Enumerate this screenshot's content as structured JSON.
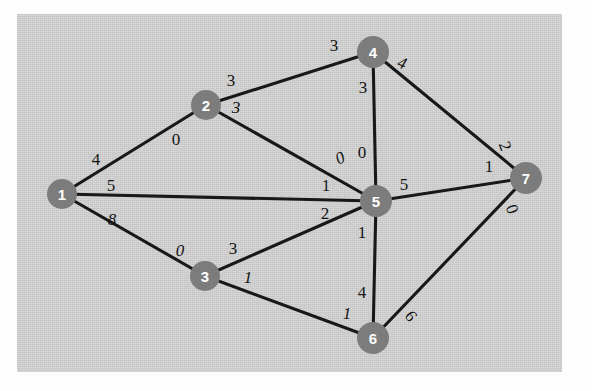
{
  "figure": {
    "kind": "weighted-undirected-graph",
    "background_color": "#d2d2d2",
    "page_color": "#fdfdfd",
    "node_color": "#7c7c7c",
    "node_text_color": "#ffffff",
    "edge_color": "#181818",
    "label_color": "#131313"
  },
  "chart_data": {
    "type": "diagram",
    "title": "",
    "nodes": [
      {
        "id": "1",
        "label": "1",
        "x": 62,
        "y": 194,
        "r": 15
      },
      {
        "id": "2",
        "label": "2",
        "x": 206,
        "y": 105,
        "r": 15
      },
      {
        "id": "3",
        "label": "3",
        "x": 205,
        "y": 276,
        "r": 15
      },
      {
        "id": "4",
        "label": "4",
        "x": 373,
        "y": 52,
        "r": 16
      },
      {
        "id": "5",
        "label": "5",
        "x": 376,
        "y": 201,
        "r": 16
      },
      {
        "id": "6",
        "label": "6",
        "x": 373,
        "y": 338,
        "r": 16
      },
      {
        "id": "7",
        "label": "7",
        "x": 526,
        "y": 178,
        "r": 16
      }
    ],
    "edges": [
      {
        "from": "1",
        "to": "2",
        "label_from": "4",
        "label_to": "0"
      },
      {
        "from": "1",
        "to": "5",
        "label_from": "5",
        "label_to": "1"
      },
      {
        "from": "1",
        "to": "3",
        "label_from": "8",
        "label_to": "0"
      },
      {
        "from": "2",
        "to": "4",
        "label_from": "3",
        "label_to": "3"
      },
      {
        "from": "2",
        "to": "5",
        "label_from": "3",
        "label_to": "0"
      },
      {
        "from": "4",
        "to": "5",
        "label_from": "3",
        "label_to": "0"
      },
      {
        "from": "4",
        "to": "7",
        "label_from": "4",
        "label_to": "2"
      },
      {
        "from": "5",
        "to": "7",
        "label_from": "5",
        "label_to": "1"
      },
      {
        "from": "3",
        "to": "5",
        "label_from": "3",
        "label_to": "2"
      },
      {
        "from": "3",
        "to": "6",
        "label_from": "1",
        "label_to": "1"
      },
      {
        "from": "5",
        "to": "6",
        "label_from": "1",
        "label_to": "4"
      },
      {
        "from": "6",
        "to": "7",
        "label_from": "6",
        "label_to": "0"
      }
    ],
    "edge_labels": [
      {
        "name": "edge-label-1-2-near-1",
        "text": "4",
        "x": 96,
        "y": 159,
        "rot": 0,
        "italic": false
      },
      {
        "name": "edge-label-1-2-near-2",
        "text": "0",
        "x": 176,
        "y": 139,
        "rot": 0,
        "italic": false
      },
      {
        "name": "edge-label-1-5-near-1",
        "text": "5",
        "x": 111,
        "y": 185,
        "rot": 0,
        "italic": false
      },
      {
        "name": "edge-label-1-5-near-5",
        "text": "1",
        "x": 326,
        "y": 185,
        "rot": 0,
        "italic": false
      },
      {
        "name": "edge-label-1-3-near-1",
        "text": "8",
        "x": 112,
        "y": 219,
        "rot": 0,
        "italic": true
      },
      {
        "name": "edge-label-1-3-near-3",
        "text": "0",
        "x": 180,
        "y": 250,
        "rot": 0,
        "italic": true
      },
      {
        "name": "edge-label-2-4-near-2",
        "text": "3",
        "x": 231,
        "y": 80,
        "rot": 0,
        "italic": false
      },
      {
        "name": "edge-label-2-4-near-4",
        "text": "3",
        "x": 334,
        "y": 45,
        "rot": 0,
        "italic": false
      },
      {
        "name": "edge-label-2-5-near-2",
        "text": "3",
        "x": 236,
        "y": 107,
        "rot": 0,
        "italic": true
      },
      {
        "name": "edge-label-2-5-near-5",
        "text": "0",
        "x": 340,
        "y": 158,
        "rot": -25,
        "italic": true
      },
      {
        "name": "edge-label-4-5-near-4",
        "text": "3",
        "x": 363,
        "y": 87,
        "rot": 0,
        "italic": false
      },
      {
        "name": "edge-label-4-5-near-5",
        "text": "0",
        "x": 362,
        "y": 152,
        "rot": 0,
        "italic": false
      },
      {
        "name": "edge-label-4-7-near-4",
        "text": "4",
        "x": 402,
        "y": 63,
        "rot": 20,
        "italic": true
      },
      {
        "name": "edge-label-4-7-near-7",
        "text": "2",
        "x": 505,
        "y": 146,
        "rot": 70,
        "italic": false
      },
      {
        "name": "edge-label-5-7-near-5",
        "text": "5",
        "x": 404,
        "y": 184,
        "rot": 0,
        "italic": false
      },
      {
        "name": "edge-label-5-7-near-7",
        "text": "1",
        "x": 489,
        "y": 166,
        "rot": 0,
        "italic": false
      },
      {
        "name": "edge-label-3-5-near-3",
        "text": "3",
        "x": 233,
        "y": 248,
        "rot": 0,
        "italic": false
      },
      {
        "name": "edge-label-3-5-near-5",
        "text": "2",
        "x": 325,
        "y": 213,
        "rot": 0,
        "italic": false
      },
      {
        "name": "edge-label-3-6-near-3",
        "text": "1",
        "x": 248,
        "y": 277,
        "rot": 0,
        "italic": true
      },
      {
        "name": "edge-label-3-6-near-6",
        "text": "1",
        "x": 347,
        "y": 313,
        "rot": 0,
        "italic": true
      },
      {
        "name": "edge-label-5-6-near-5",
        "text": "1",
        "x": 362,
        "y": 232,
        "rot": 0,
        "italic": false
      },
      {
        "name": "edge-label-5-6-near-6",
        "text": "4",
        "x": 362,
        "y": 292,
        "rot": 0,
        "italic": false
      },
      {
        "name": "edge-label-6-7-near-6",
        "text": "6",
        "x": 411,
        "y": 316,
        "rot": 55,
        "italic": false
      },
      {
        "name": "edge-label-6-7-near-7",
        "text": "0",
        "x": 512,
        "y": 209,
        "rot": 70,
        "italic": false
      }
    ],
    "xlabel": "",
    "ylabel": "",
    "legend": []
  }
}
